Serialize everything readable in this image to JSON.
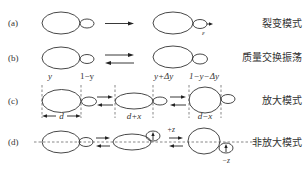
{
  "rows": [
    {
      "id": "a",
      "label": "(a)",
      "mode": "裂变模式",
      "annotations": {
        "epsilon": "ε"
      }
    },
    {
      "id": "b",
      "label": "(b)",
      "mode": "质量交换振荡",
      "annotations": {
        "left_big": "y",
        "left_small": "1−y",
        "right_big": "y+Δy",
        "right_small": "1−y−Δy"
      }
    },
    {
      "id": "c",
      "label": "(c)",
      "mode": "放大模式",
      "annotations": {
        "width_1": "d",
        "width_2": "d+x",
        "width_3": "d−x"
      }
    },
    {
      "id": "d",
      "label": "(d)",
      "mode": "非放大模式",
      "annotations": {
        "plus_z": "+z",
        "minus_z": "−z"
      }
    }
  ],
  "colors": {
    "line": "#333333",
    "dashed": "#555555",
    "background": "#ffffff"
  }
}
